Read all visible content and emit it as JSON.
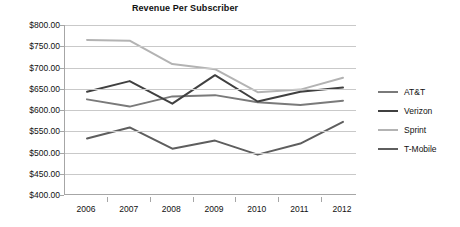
{
  "chart_data": {
    "type": "line",
    "title": "Revenue Per Subscriber",
    "xlabel": "",
    "ylabel": "",
    "x": [
      "2006",
      "2007",
      "2008",
      "2009",
      "2010",
      "2011",
      "2012"
    ],
    "categories": [
      "2006",
      "2007",
      "2008",
      "2009",
      "2010",
      "2011",
      "2012"
    ],
    "ylim": [
      400,
      800
    ],
    "ytick_values": [
      400,
      450,
      500,
      550,
      600,
      650,
      700,
      750,
      800
    ],
    "ytick_labels": [
      "$400.00",
      "$450.00",
      "$500.00",
      "$550.00",
      "$600.00",
      "$650.00",
      "$700.00",
      "$750.00",
      "$800.00"
    ],
    "grid": true,
    "legend_position": "right",
    "series": [
      {
        "name": "AT&T",
        "color": "#7a7a7a",
        "values": [
          625,
          608,
          632,
          635,
          618,
          612,
          622
        ]
      },
      {
        "name": "Verizon",
        "color": "#404040",
        "values": [
          643,
          668,
          615,
          682,
          620,
          643,
          653
        ]
      },
      {
        "name": "Sprint",
        "color": "#b3b3b3",
        "values": [
          765,
          763,
          708,
          696,
          642,
          648,
          676
        ]
      },
      {
        "name": "T-Mobile",
        "color": "#5e5e5e",
        "values": [
          533,
          559,
          509,
          528,
          495,
          521,
          572
        ]
      }
    ]
  },
  "legend": {
    "items": [
      {
        "label": "AT&T"
      },
      {
        "label": "Verizon"
      },
      {
        "label": "Sprint"
      },
      {
        "label": "T-Mobile"
      }
    ]
  },
  "colors": {
    "gridline": "#c9c9c9",
    "axis": "#a6a6a6",
    "text": "#111111",
    "background": "#ffffff"
  }
}
